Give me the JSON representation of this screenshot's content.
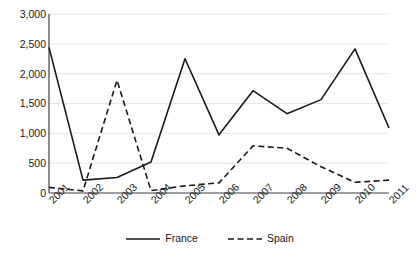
{
  "chart_data": {
    "type": "line",
    "title": "",
    "subtitle": "",
    "xlabel": "",
    "ylabel": "",
    "categories": [
      "2001",
      "2002",
      "2003",
      "2004",
      "2005",
      "2006",
      "2007",
      "2008",
      "2009",
      "2010",
      "2011"
    ],
    "series": [
      {
        "name": "France",
        "style": "solid",
        "color": "#1a1a1a",
        "values": [
          2440,
          215,
          260,
          520,
          2250,
          975,
          1715,
          1330,
          1565,
          2415,
          1090
        ]
      },
      {
        "name": "Spain",
        "style": "dashed",
        "color": "#1a1a1a",
        "values": [
          95,
          35,
          1890,
          40,
          120,
          170,
          790,
          750,
          440,
          180,
          215
        ]
      }
    ],
    "ylim": [
      0,
      3000
    ],
    "yticks": [
      0,
      500,
      1000,
      1500,
      2000,
      2500,
      3000
    ],
    "ytick_labels": [
      "0",
      "500",
      "1,000",
      "1,500",
      "2,000",
      "2,500",
      "3,000"
    ],
    "grid": "horizontal",
    "legend_position": "bottom"
  },
  "axes": {
    "y_axis_label": "",
    "x_axis_label": ""
  },
  "legend": {
    "items": [
      {
        "label": "France",
        "style": "solid"
      },
      {
        "label": "Spain",
        "style": "dashed"
      }
    ]
  }
}
